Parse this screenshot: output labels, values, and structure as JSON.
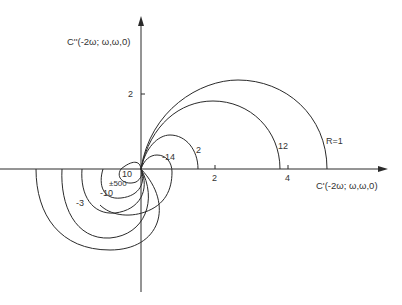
{
  "diagram": {
    "y_axis": {
      "label": "C''(-2ω; ω,ω,0)",
      "ticks": [
        {
          "value": "2"
        }
      ]
    },
    "x_axis": {
      "label": "C'(-2ω; ω,ω,0)",
      "ticks": [
        {
          "value": "2"
        },
        {
          "value": "4"
        }
      ]
    },
    "curves": [
      {
        "label": "R=1"
      },
      {
        "label": "12"
      },
      {
        "label": "2"
      },
      {
        "label": "-14"
      },
      {
        "label": "10"
      },
      {
        "label": "±500"
      },
      {
        "label": "-10"
      },
      {
        "label": "-3"
      }
    ],
    "colors": {
      "line": "#2a2a2a",
      "background": "#ffffff"
    }
  },
  "caption": {
    "text": ""
  }
}
